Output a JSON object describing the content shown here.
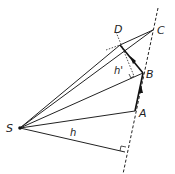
{
  "diagram": {
    "points": {
      "S": {
        "label": "S",
        "x": 20,
        "y": 128
      },
      "A": {
        "label": "A",
        "x": 135,
        "y": 111
      },
      "B": {
        "label": "B",
        "x": 143,
        "y": 73
      },
      "C": {
        "label": "C",
        "x": 153,
        "y": 30
      },
      "D": {
        "label": "D",
        "x": 120,
        "y": 45
      }
    },
    "labels": {
      "S": "S",
      "A": "A",
      "B": "B",
      "C": "C",
      "D": "D",
      "h": "h",
      "h_prime": "h'"
    },
    "colors": {
      "line": "#1a1a1a",
      "background": "#ffffff"
    }
  }
}
